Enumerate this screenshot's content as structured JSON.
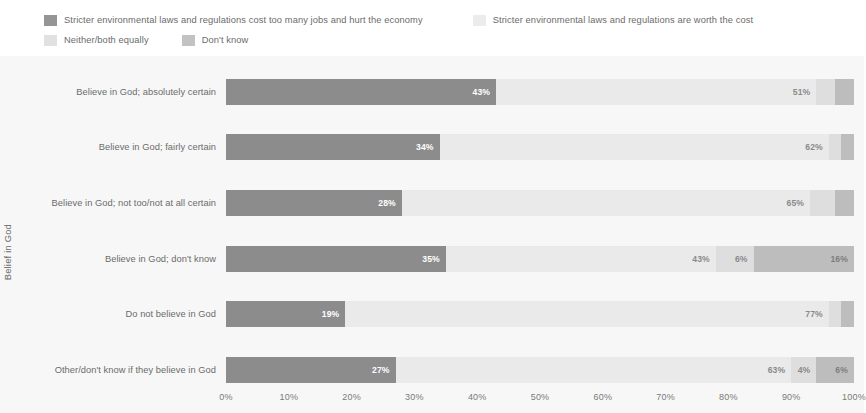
{
  "legend": {
    "items": [
      {
        "label": "Stricter environmental laws and regulations cost too many jobs and hurt the economy",
        "color": "#8c8c8c",
        "key": "cost_jobs"
      },
      {
        "label": "Stricter environmental laws and regulations are worth the cost",
        "color": "#eaeaea",
        "key": "worth_cost"
      },
      {
        "label": "Neither/both equally",
        "color": "#dedede",
        "key": "neither"
      },
      {
        "label": "Don't know",
        "color": "#bdbdbd",
        "key": "dont_know"
      }
    ]
  },
  "chart_data": {
    "type": "bar",
    "orientation": "horizontal",
    "stacked": true,
    "normalized_percent": true,
    "title": "",
    "subtitle": "",
    "xlabel": "",
    "ylabel": "Belief in God",
    "xlim": [
      0,
      100
    ],
    "xticks": [
      "0%",
      "10%",
      "20%",
      "30%",
      "40%",
      "50%",
      "60%",
      "70%",
      "80%",
      "90%",
      "100%"
    ],
    "xtick_values": [
      0,
      10,
      20,
      30,
      40,
      50,
      60,
      70,
      80,
      90,
      100
    ],
    "grid": false,
    "legend_position": "top-left",
    "categories": [
      "Believe in God; absolutely certain",
      "Believe in God; fairly certain",
      "Believe in God; not too/not at all certain",
      "Believe in God; don't know",
      "Do not believe in God",
      "Other/don't know if they believe in God"
    ],
    "series": [
      {
        "name": "Stricter environmental laws and regulations cost too many jobs and hurt the economy",
        "color": "#8c8c8c",
        "values": [
          43,
          34,
          28,
          35,
          19,
          27
        ],
        "labels": [
          "43%",
          "34%",
          "28%",
          "35%",
          "19%",
          "27%"
        ]
      },
      {
        "name": "Stricter environmental laws and regulations are worth the cost",
        "color": "#eaeaea",
        "values": [
          51,
          62,
          65,
          43,
          77,
          63
        ],
        "labels": [
          "51%",
          "62%",
          "65%",
          "43%",
          "77%",
          "63%"
        ]
      },
      {
        "name": "Neither/both equally",
        "color": "#dedede",
        "values": [
          3,
          2,
          4,
          6,
          2,
          4
        ],
        "labels": [
          "",
          "",
          "",
          "6%",
          "",
          "4%"
        ]
      },
      {
        "name": "Don't know",
        "color": "#bdbdbd",
        "values": [
          3,
          2,
          3,
          16,
          2,
          6
        ],
        "labels": [
          "",
          "",
          "",
          "16%",
          "",
          "6%"
        ]
      }
    ]
  }
}
